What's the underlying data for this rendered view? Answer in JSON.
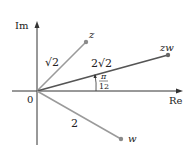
{
  "figure": {
    "type": "complex-plane-diagram",
    "axes": {
      "real_label": "Re",
      "imag_label": "Im",
      "origin_label": "0"
    },
    "points": [
      {
        "id": "z",
        "label": "z",
        "modulus_label": "√2",
        "argument": "π/4"
      },
      {
        "id": "zw",
        "label": "zw",
        "modulus_label": "2√2",
        "argument": "π/12"
      },
      {
        "id": "w",
        "label": "w",
        "modulus_label": "2",
        "argument": "-π/6"
      }
    ],
    "angle_label": {
      "numerator": "π",
      "denominator": "12"
    },
    "colors": {
      "axis": "#333333",
      "z_line": "#9a9a9a",
      "zw_line": "#555555",
      "w_line": "#9a9a9a",
      "point": "#8a8a8a"
    }
  }
}
